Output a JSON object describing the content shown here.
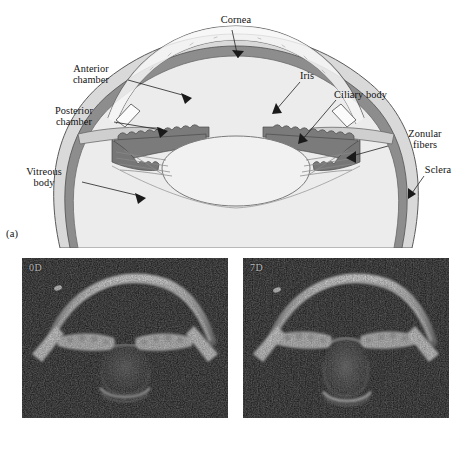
{
  "figure": {
    "panels": [
      {
        "tag": "(a)",
        "kind": "schematic-diagram"
      },
      {
        "tag": "(b)",
        "kind": "oct-b-scan-pair"
      }
    ]
  },
  "panel_a": {
    "tag": "(a)",
    "description": "Cross-sectional schematic of the anterior segment of the human eye",
    "labels": [
      {
        "id": "cornea",
        "text": "Cornea",
        "align": "center"
      },
      {
        "id": "anterior_chamber",
        "text": "Anterior\nchamber",
        "align": "center"
      },
      {
        "id": "posterior_chamber",
        "text": "Posterior\nchamber",
        "align": "center"
      },
      {
        "id": "vitreous_body",
        "text": "Vitreous\nbody",
        "align": "center"
      },
      {
        "id": "iris",
        "text": "Iris",
        "align": "left"
      },
      {
        "id": "ciliary_body",
        "text": "Ciliary body",
        "align": "left"
      },
      {
        "id": "zonular_fibers",
        "text": "Zonular\nfibers",
        "align": "center"
      },
      {
        "id": "sclera",
        "text": "Sclera",
        "align": "center"
      }
    ],
    "colors": {
      "sclera_fill": "#d8d8d8",
      "choroid_fill": "#8e8e8e",
      "interior_fill": "#ececec",
      "iris_fill": "#7c7c7c",
      "lens_fill": "#efefef",
      "cornea_fill": "#f4f4f4",
      "outline": "#4a4a4a",
      "leader_line": "#2b2b2b",
      "text": "#111111"
    }
  },
  "panel_b": {
    "tag": "(b)",
    "description": "Paired anterior-segment OCT B-scans of the crystalline lens under accommodative demand",
    "scans": [
      {
        "id": "scan-0d",
        "label": "0D",
        "accommodative_demand_diopters": 0,
        "note": "unaccommodated, thinner and flatter lens"
      },
      {
        "id": "scan-7d",
        "label": "7D",
        "accommodative_demand_diopters": 7,
        "note": "accommodated, thicker and more steeply curved lens"
      }
    ],
    "colors": {
      "background": "#0d0d0d",
      "label_text": "#b9b9b9",
      "bright_tissue": "#e8e8e8",
      "mid_tissue": "#8a8a8a"
    }
  }
}
